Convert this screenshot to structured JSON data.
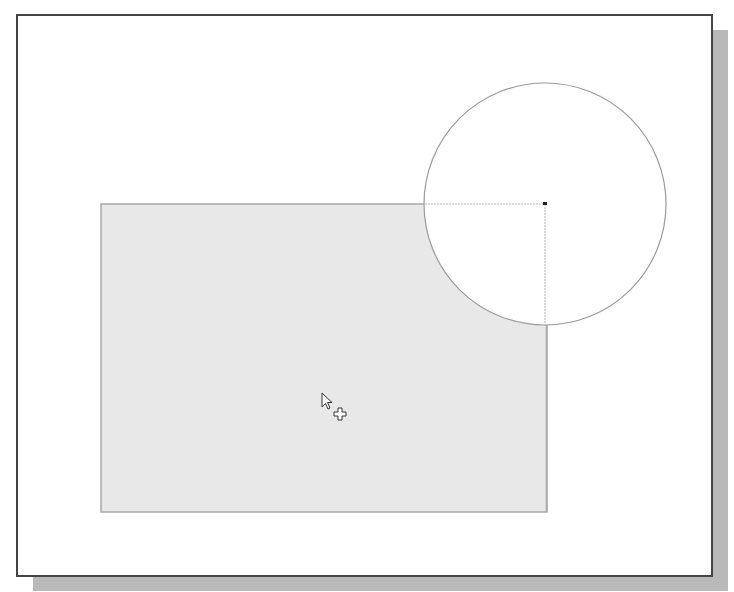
{
  "canvas": {
    "width": 734,
    "height": 592,
    "background": "#ffffff"
  },
  "frame": {
    "border_color": "#444444",
    "shadow_color": "#b9b9b9"
  },
  "shapes": {
    "rectangle": {
      "x": 101,
      "y": 204,
      "width": 446,
      "height": 308,
      "fill": "#e8e8e8",
      "stroke": "#a9a9a9"
    },
    "circle": {
      "cx": 545,
      "cy": 204,
      "r": 121,
      "fill": "#ffffff",
      "stroke": "#9a9a9a"
    },
    "corner_marker": {
      "x": 543,
      "y": 202,
      "color": "#222222"
    }
  },
  "cursor": {
    "icon": "arrow-with-plus-cursor",
    "x": 322,
    "y": 393
  }
}
